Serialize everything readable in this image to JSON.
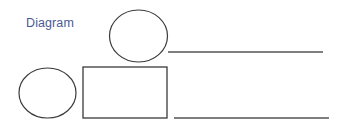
{
  "title": "Diagram",
  "colors": {
    "title": "#4b5a96",
    "stroke": "#3a3a3a",
    "line": "#555555",
    "background": "#ffffff"
  },
  "shapes": [
    {
      "type": "ellipse",
      "name": "top-ellipse",
      "cx": 138.5,
      "cy": 36,
      "rx": 29,
      "ry": 26
    },
    {
      "type": "line",
      "name": "top-line",
      "x1": 168,
      "y1": 52,
      "x2": 323,
      "y2": 52
    },
    {
      "type": "ellipse",
      "name": "left-ellipse",
      "cx": 47.5,
      "cy": 93,
      "rx": 28.5,
      "ry": 25
    },
    {
      "type": "rect",
      "name": "center-rectangle",
      "x": 83,
      "y": 67,
      "width": 84,
      "height": 51
    },
    {
      "type": "line",
      "name": "bottom-line",
      "x1": 174,
      "y1": 118,
      "x2": 329,
      "y2": 118
    }
  ]
}
